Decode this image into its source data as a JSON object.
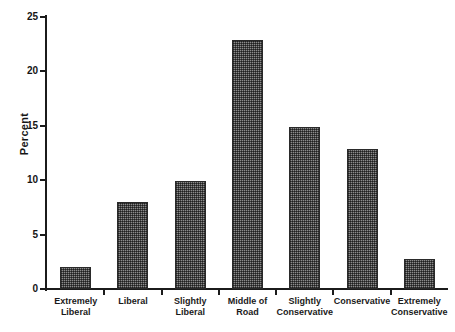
{
  "chart_data": {
    "type": "bar",
    "title": "",
    "xlabel": "",
    "ylabel": "Percent",
    "ylim": [
      0,
      25
    ],
    "yticks": [
      0,
      5,
      10,
      15,
      20,
      25
    ],
    "grid": false,
    "legend": "none",
    "categories": [
      "Extremely Liberal",
      "Liberal",
      "Slightly Liberal",
      "Middle of Road",
      "Slightly Conservative",
      "Conservative",
      "Extremely Conservative"
    ],
    "category_lines": [
      [
        "Extremely",
        "Liberal"
      ],
      [
        "Liberal",
        ""
      ],
      [
        "Slightly",
        "Liberal"
      ],
      [
        "Middle of",
        "Road"
      ],
      [
        "Slightly",
        "Conservative"
      ],
      [
        "Conservative",
        ""
      ],
      [
        "Extremely",
        "Conservative"
      ]
    ],
    "values": [
      2.0,
      8.0,
      9.9,
      22.9,
      14.9,
      12.9,
      2.8
    ],
    "bar_fill": "#8c8c8c",
    "bar_edge": "#2a2a2a",
    "axis_color": "#1b1b1b",
    "background": "#ffffff"
  },
  "axis": {
    "y_tick_labels": [
      "25",
      "20",
      "15",
      "10",
      "5",
      "0"
    ],
    "y_title": "Percent"
  },
  "caption": {
    "text": ""
  }
}
